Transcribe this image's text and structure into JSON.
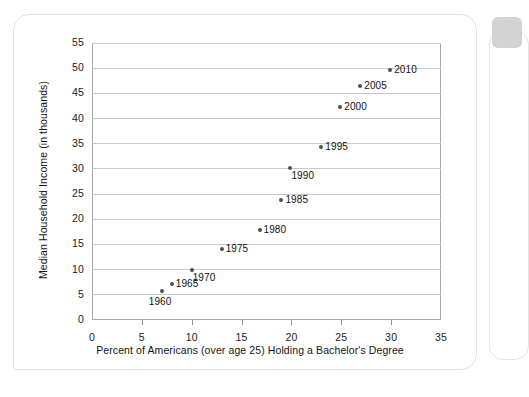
{
  "card": {
    "background": "#ffffff",
    "border_color": "#e2e2e2"
  },
  "side_panel": {
    "header_color": "#d3d3d3",
    "border_color": "#e4e4e4"
  },
  "chart_data": {
    "type": "scatter",
    "title": "",
    "xlabel": "Percent of Americans (over age 25) Holding a Bachelor's Degree",
    "ylabel": "Median Household Income (in thousands)",
    "xlim": [
      0,
      35
    ],
    "ylim": [
      0,
      55
    ],
    "xticks": [
      0,
      5,
      10,
      15,
      20,
      25,
      30,
      35
    ],
    "yticks": [
      0,
      5,
      10,
      15,
      20,
      25,
      30,
      35,
      40,
      45,
      50,
      55
    ],
    "grid": "horizontal",
    "legend": "none",
    "marker_color": "#4d4d52",
    "gridline_color": "#c9c9c9",
    "frame_color": "#a8a8a8",
    "points": [
      {
        "label": "1960",
        "x": 7.0,
        "y": 5.7,
        "label_pos": "below"
      },
      {
        "label": "1965",
        "x": 8.0,
        "y": 7.2,
        "label_pos": "right"
      },
      {
        "label": "1970",
        "x": 10.0,
        "y": 10.0,
        "label_pos": "below-right"
      },
      {
        "label": "1975",
        "x": 13.0,
        "y": 14.0,
        "label_pos": "right"
      },
      {
        "label": "1980",
        "x": 16.8,
        "y": 17.8,
        "label_pos": "right"
      },
      {
        "label": "1985",
        "x": 19.0,
        "y": 23.8,
        "label_pos": "right"
      },
      {
        "label": "1990",
        "x": 19.9,
        "y": 30.2,
        "label_pos": "below-right"
      },
      {
        "label": "1995",
        "x": 23.0,
        "y": 34.4,
        "label_pos": "right"
      },
      {
        "label": "2000",
        "x": 24.9,
        "y": 42.2,
        "label_pos": "right"
      },
      {
        "label": "2005",
        "x": 26.9,
        "y": 46.5,
        "label_pos": "right"
      },
      {
        "label": "2010",
        "x": 29.9,
        "y": 49.6,
        "label_pos": "right"
      }
    ]
  }
}
